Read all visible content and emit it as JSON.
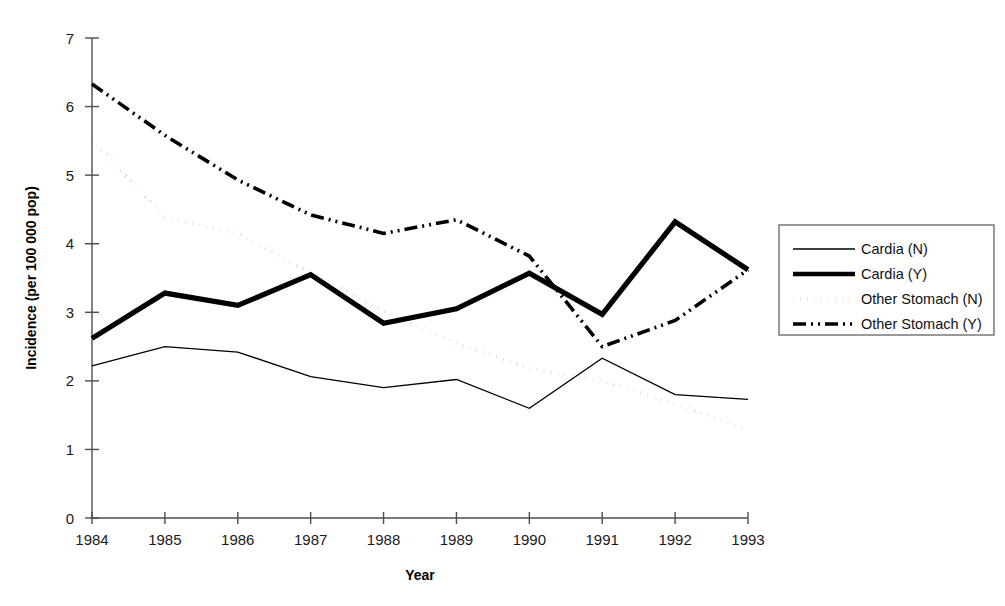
{
  "chart_data": {
    "type": "line",
    "title": "",
    "xlabel": "Year",
    "ylabel": "Incidence (per 100 000 pop)",
    "categories": [
      "1984",
      "1985",
      "1986",
      "1987",
      "1988",
      "1989",
      "1990",
      "1991",
      "1992",
      "1993"
    ],
    "x": [
      1984,
      1985,
      1986,
      1987,
      1988,
      1989,
      1990,
      1991,
      1992,
      1993
    ],
    "xlim": [
      1984,
      1993
    ],
    "ylim": [
      0,
      7
    ],
    "yticks": [
      "0",
      "1",
      "2",
      "3",
      "4",
      "5",
      "6",
      "7"
    ],
    "ytick_values": [
      0,
      1,
      2,
      3,
      4,
      5,
      6,
      7
    ],
    "grid": false,
    "legend_position": "right",
    "series": [
      {
        "name": "Cardia (N)",
        "style": "solid-thin",
        "values": [
          2.22,
          2.5,
          2.42,
          2.06,
          1.9,
          2.02,
          1.6,
          2.33,
          1.8,
          1.73
        ]
      },
      {
        "name": "Cardia (Y)",
        "style": "solid-thick",
        "values": [
          2.62,
          3.28,
          3.1,
          3.55,
          2.84,
          3.05,
          3.57,
          2.97,
          4.32,
          3.62
        ]
      },
      {
        "name": "Other Stomach (N)",
        "style": "dotted",
        "values": [
          5.52,
          4.38,
          4.15,
          3.57,
          3.02,
          2.55,
          2.18,
          2.0,
          1.67,
          1.28
        ]
      },
      {
        "name": "Other Stomach (Y)",
        "style": "dash-dot",
        "values": [
          6.33,
          5.58,
          4.93,
          4.42,
          4.15,
          4.35,
          3.82,
          2.5,
          2.88,
          3.62
        ]
      }
    ]
  },
  "legend": {
    "items": [
      {
        "label": "Cardia (N)",
        "style": "solid-thin"
      },
      {
        "label": "Cardia (Y)",
        "style": "solid-thick"
      },
      {
        "label": "Other Stomach (N)",
        "style": "dotted"
      },
      {
        "label": "Other Stomach (Y)",
        "style": "dash-dot"
      }
    ]
  }
}
